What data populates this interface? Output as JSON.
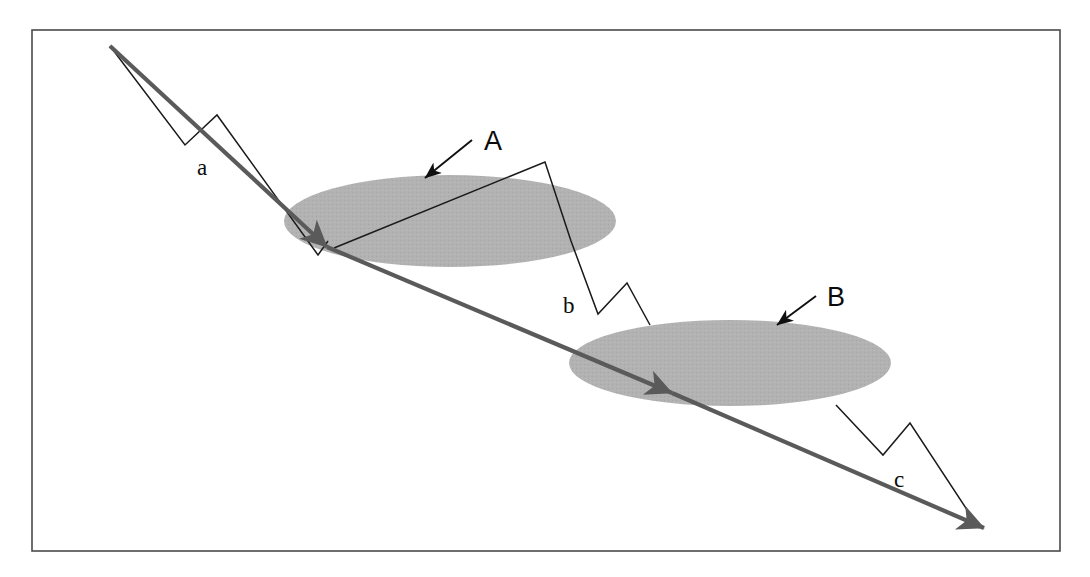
{
  "figure": {
    "kind": "schematic-diagram",
    "background_color": "#ffffff",
    "frame": {
      "name": "figure-border",
      "x": 32,
      "y": 30,
      "width": 1028,
      "height": 521,
      "stroke": "#4a4a4a",
      "stroke_width": 1.6,
      "fill": "none"
    },
    "colors": {
      "ellipse_fill": "#b2b2b2",
      "thick_arrow": "#5a5a5a",
      "thin_zigzag": "#1a1a1a",
      "pointer_arrow": "#101010",
      "label_text": "#0b0b0b",
      "frame_stroke": "#4a4a4a"
    },
    "planes": [
      {
        "id": "A",
        "label": "A",
        "label_style": "sans",
        "label_x": 484,
        "label_y": 150,
        "cx": 450,
        "cy": 221,
        "rx": 166,
        "ry": 46,
        "fill": "#b2b2b2",
        "pointer": {
          "name": "pointer-arrow-a",
          "from_x": 472,
          "from_y": 140,
          "to_x": 425,
          "to_y": 178
        }
      },
      {
        "id": "B",
        "label": "B",
        "label_style": "sans",
        "label_x": 827,
        "label_y": 306,
        "cx": 730,
        "cy": 363,
        "rx": 161,
        "ry": 43,
        "fill": "#b2b2b2",
        "pointer": {
          "name": "pointer-arrow-b",
          "from_x": 816,
          "from_y": 296,
          "to_x": 777,
          "to_y": 325
        }
      }
    ],
    "segments": [
      {
        "id": "a",
        "label": "a",
        "label_style": "serif",
        "label_x": 197,
        "label_y": 175,
        "thick_arrow": {
          "name": "ray-segment-a",
          "x1": 110,
          "y1": 46,
          "x2": 327,
          "y2": 247,
          "stroke": "#5a5a5a",
          "stroke_width": 4.2,
          "arrowhead": true
        },
        "zigzag": {
          "name": "zigzag-a",
          "stroke": "#1a1a1a",
          "stroke_width": 1.5,
          "points": "110,46 185,145 217,115 318,255 328,241"
        }
      },
      {
        "id": "b",
        "label": "b",
        "label_style": "serif",
        "label_x": 563,
        "label_y": 313,
        "thick_arrow": {
          "name": "ray-segment-b",
          "x1": 327,
          "y1": 247,
          "x2": 672,
          "y2": 393,
          "stroke": "#5a5a5a",
          "stroke_width": 4.2,
          "arrowhead": true
        },
        "zigzag": {
          "name": "zigzag-b",
          "stroke": "#1a1a1a",
          "stroke_width": 1.5,
          "points": "334,248 545,162 571,241 598,314 627,283 650,325"
        }
      },
      {
        "id": "c",
        "label": "c",
        "label_style": "serif",
        "label_x": 894,
        "label_y": 487,
        "thick_arrow": {
          "name": "ray-segment-c",
          "x1": 672,
          "y1": 393,
          "x2": 984,
          "y2": 528,
          "stroke": "#5a5a5a",
          "stroke_width": 4.2,
          "arrowhead": true
        },
        "zigzag": {
          "name": "zigzag-c",
          "stroke": "#1a1a1a",
          "stroke_width": 1.5,
          "points": "836,405 883,455 910,423 979,528"
        }
      }
    ]
  }
}
